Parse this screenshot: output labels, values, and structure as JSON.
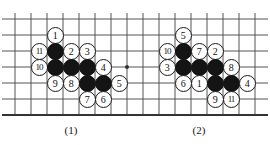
{
  "figure": {
    "type": "go-board-problem-diagram",
    "board": {
      "width": 270,
      "height": 145,
      "grid_spacing": 16,
      "line_color": "#555555",
      "edge_color": "#333333",
      "background_color": "#ffffff",
      "vertical_lines_x": [
        15,
        31,
        47,
        63,
        79,
        95,
        111,
        127,
        143,
        159,
        175,
        191,
        207,
        223,
        239,
        255
      ],
      "horizontal_lines_y": [
        19,
        35,
        51,
        67,
        83,
        99
      ],
      "bottom_edge_y": 115,
      "star_points": [
        {
          "x": 127,
          "y": 67
        }
      ]
    },
    "diagrams": [
      {
        "id": "diagram-1",
        "caption": "(1)",
        "caption_x": 71,
        "caption_y": 124,
        "stones": [
          {
            "color": "white",
            "label": "1",
            "x": 55,
            "y": 35
          },
          {
            "color": "white",
            "label": "11",
            "x": 39,
            "y": 51
          },
          {
            "color": "black",
            "label": "",
            "x": 55,
            "y": 51
          },
          {
            "color": "white",
            "label": "2",
            "x": 71,
            "y": 51
          },
          {
            "color": "white",
            "label": "3",
            "x": 87,
            "y": 51
          },
          {
            "color": "white",
            "label": "10",
            "x": 39,
            "y": 67
          },
          {
            "color": "black",
            "label": "",
            "x": 55,
            "y": 67
          },
          {
            "color": "black",
            "label": "",
            "x": 71,
            "y": 67
          },
          {
            "color": "black",
            "label": "",
            "x": 87,
            "y": 67
          },
          {
            "color": "white",
            "label": "4",
            "x": 103,
            "y": 67
          },
          {
            "color": "white",
            "label": "9",
            "x": 55,
            "y": 83
          },
          {
            "color": "white",
            "label": "8",
            "x": 71,
            "y": 83
          },
          {
            "color": "black",
            "label": "",
            "x": 87,
            "y": 83
          },
          {
            "color": "black",
            "label": "",
            "x": 103,
            "y": 83
          },
          {
            "color": "white",
            "label": "5",
            "x": 119,
            "y": 83
          },
          {
            "color": "white",
            "label": "7",
            "x": 87,
            "y": 99
          },
          {
            "color": "white",
            "label": "6",
            "x": 103,
            "y": 99
          }
        ]
      },
      {
        "id": "diagram-2",
        "caption": "(2)",
        "caption_x": 199,
        "caption_y": 124,
        "stones": [
          {
            "color": "white",
            "label": "5",
            "x": 183,
            "y": 35
          },
          {
            "color": "white",
            "label": "10",
            "x": 167,
            "y": 51
          },
          {
            "color": "black",
            "label": "",
            "x": 183,
            "y": 51
          },
          {
            "color": "white",
            "label": "7",
            "x": 199,
            "y": 51
          },
          {
            "color": "white",
            "label": "2",
            "x": 215,
            "y": 51
          },
          {
            "color": "white",
            "label": "3",
            "x": 167,
            "y": 67
          },
          {
            "color": "black",
            "label": "",
            "x": 183,
            "y": 67
          },
          {
            "color": "black",
            "label": "",
            "x": 199,
            "y": 67
          },
          {
            "color": "black",
            "label": "",
            "x": 215,
            "y": 67
          },
          {
            "color": "white",
            "label": "8",
            "x": 231,
            "y": 67
          },
          {
            "color": "white",
            "label": "6",
            "x": 183,
            "y": 83
          },
          {
            "color": "white",
            "label": "1",
            "x": 199,
            "y": 83
          },
          {
            "color": "black",
            "label": "",
            "x": 215,
            "y": 83
          },
          {
            "color": "black",
            "label": "",
            "x": 231,
            "y": 83
          },
          {
            "color": "white",
            "label": "4",
            "x": 247,
            "y": 83
          },
          {
            "color": "white",
            "label": "9",
            "x": 215,
            "y": 99
          },
          {
            "color": "white",
            "label": "11",
            "x": 231,
            "y": 99
          }
        ]
      }
    ]
  }
}
